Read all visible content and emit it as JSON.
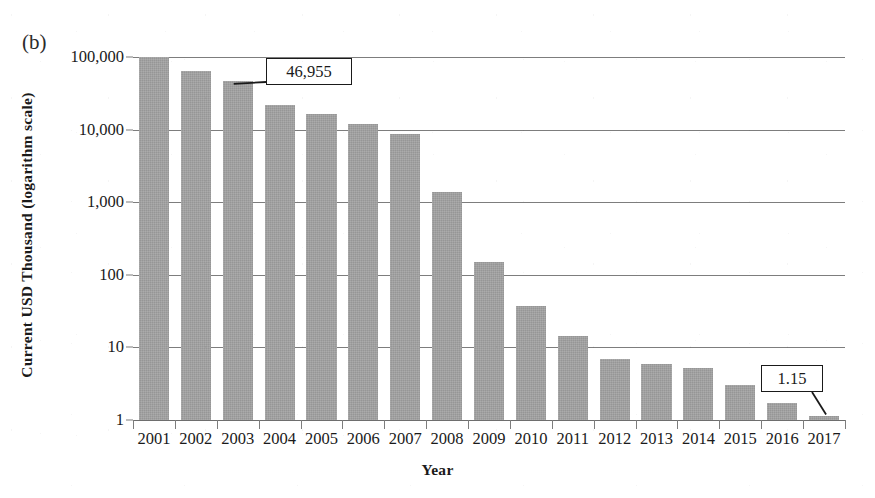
{
  "panel": {
    "label": "(b)"
  },
  "axes": {
    "ylabel": "Current USD Thousand (logarithm scale)",
    "xlabel": "Year",
    "yticks": [
      "100,000",
      "10,000",
      "1,000",
      "100",
      "10",
      "1"
    ]
  },
  "callouts": [
    {
      "name": "callout-2003",
      "text": "46,955",
      "year": "2003"
    },
    {
      "name": "callout-2017",
      "text": "1.15",
      "year": "2017"
    }
  ],
  "chart_data": {
    "type": "bar",
    "title": "",
    "subtitle": "",
    "panel_label": "(b)",
    "xlabel": "Year",
    "ylabel": "Current USD Thousand (logarithm scale)",
    "yscale": "log",
    "ylim": [
      1,
      100000
    ],
    "ytick_labels": [
      "1",
      "10",
      "100",
      "1,000",
      "10,000",
      "100,000"
    ],
    "ytick_values": [
      1,
      10,
      100,
      1000,
      10000,
      100000
    ],
    "grid": "horizontal",
    "legend": "none",
    "bar_color": "#969696",
    "categories": [
      "2001",
      "2002",
      "2003",
      "2004",
      "2005",
      "2006",
      "2007",
      "2008",
      "2009",
      "2010",
      "2011",
      "2012",
      "2013",
      "2014",
      "2015",
      "2016",
      "2017"
    ],
    "values": [
      100000,
      65000,
      46955,
      22000,
      16500,
      12000,
      8800,
      1400,
      150,
      37,
      14.5,
      7.0,
      6.0,
      5.2,
      3.0,
      1.7,
      1.15
    ],
    "annotations": [
      {
        "category": "2003",
        "text": "46,955",
        "value": 46955
      },
      {
        "category": "2017",
        "text": "1.15",
        "value": 1.15
      }
    ]
  }
}
